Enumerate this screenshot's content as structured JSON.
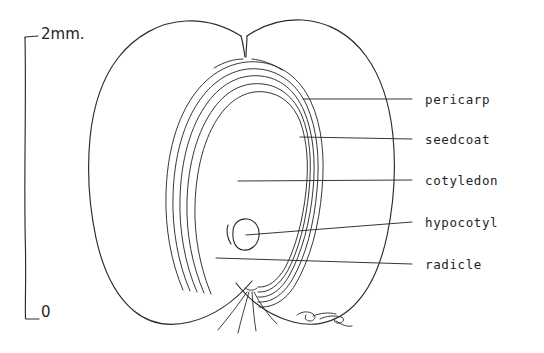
{
  "figure": {
    "background_color": "#ffffff",
    "ink_color": "#2b2b2b",
    "signature": "artist-signature"
  },
  "scale_bar": {
    "name": "scale-bar",
    "top_label": "2mm.",
    "bottom_label": "0",
    "units": "mm",
    "span_value": 2,
    "orientation": "vertical"
  },
  "labels": [
    {
      "id": "pericarp",
      "text": "pericarp",
      "text_x": 425,
      "text_y": 94,
      "leader_x1": 412,
      "leader_y1": 99,
      "leader_x2": 303,
      "leader_y2": 99
    },
    {
      "id": "seedcoat",
      "text": "seedcoat",
      "text_x": 425,
      "text_y": 134,
      "leader_x1": 412,
      "leader_y1": 139,
      "leader_x2": 300,
      "leader_y2": 137
    },
    {
      "id": "cotyledon",
      "text": "cotyledon",
      "text_x": 425,
      "text_y": 175,
      "leader_x1": 412,
      "leader_y1": 180,
      "leader_x2": 238,
      "leader_y2": 181
    },
    {
      "id": "hypocotyl",
      "text": "hypocotyl",
      "text_x": 425,
      "text_y": 217,
      "leader_x1": 412,
      "leader_y1": 222,
      "leader_x2": 246,
      "leader_y2": 235
    },
    {
      "id": "radicle",
      "text": "radicle",
      "text_x": 425,
      "text_y": 259,
      "leader_x1": 412,
      "leader_y1": 264,
      "leader_x2": 216,
      "leader_y2": 258
    }
  ],
  "structures": {
    "pericarp_left_lobe": "left outer fruit wall lobe",
    "pericarp_right_lobe": "right outer fruit wall lobe",
    "seed_coat_layers": 5,
    "cotyledon_body": "large inner teardrop-shaped cotyledon",
    "hypocotyl_knob": "small rounded knob at base of cotyledon",
    "radicle_tails": 4
  }
}
